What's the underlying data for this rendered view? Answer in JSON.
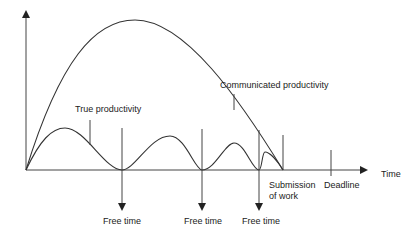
{
  "diagram": {
    "x_axis_label": "Time",
    "curves": {
      "communicated": "Communicated productivity",
      "true": "True productivity"
    },
    "free_time_markers": [
      "Free time",
      "Free time",
      "Free time"
    ],
    "submission": {
      "line1": "Submission",
      "line2": "of work"
    },
    "deadline": "Deadline",
    "colors": {
      "line": "#333333",
      "background": "#ffffff"
    }
  }
}
